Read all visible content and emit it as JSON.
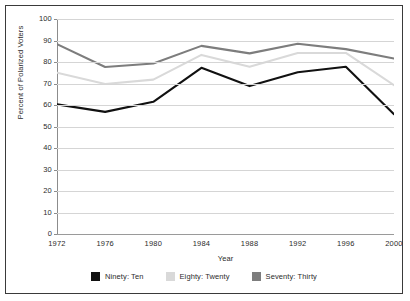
{
  "chart_data": {
    "type": "line",
    "title": "",
    "xlabel": "Year",
    "ylabel": "Percent of Polarized Voters",
    "categories": [
      "1972",
      "1976",
      "1980",
      "1984",
      "1988",
      "1992",
      "1996",
      "2000"
    ],
    "x": [
      1972,
      1976,
      1980,
      1984,
      1988,
      1992,
      1996,
      2000
    ],
    "ylim": [
      0,
      100
    ],
    "yticks": [
      0,
      10,
      20,
      30,
      40,
      50,
      60,
      70,
      80,
      90,
      100
    ],
    "grid": true,
    "legend_position": "bottom",
    "series": [
      {
        "name": "Ninety: Ten",
        "color": "#111111",
        "values": [
          60.3,
          56.8,
          61.5,
          77.3,
          68.8,
          75.2,
          77.8,
          55.7
        ]
      },
      {
        "name": "Eighty: Twenty",
        "color": "#d9d9d9",
        "values": [
          75.0,
          69.8,
          71.8,
          83.3,
          77.8,
          84.2,
          84.2,
          69.2
        ]
      },
      {
        "name": "Seventy: Thirty",
        "color": "#7d7d7d",
        "values": [
          88.3,
          77.7,
          79.3,
          87.5,
          84.0,
          88.5,
          86.0,
          81.6
        ]
      }
    ]
  },
  "axes": {
    "ytick_labels": [
      "100",
      "90",
      "80",
      "70",
      "60",
      "50",
      "40",
      "30",
      "20",
      "10",
      "0"
    ],
    "xtick_labels": [
      "1972",
      "1976",
      "1980",
      "1984",
      "1988",
      "1992",
      "1996",
      "2000"
    ],
    "y_title": "Percent of Polarized Voters",
    "x_title": "Year"
  },
  "legend": {
    "items": [
      {
        "label": "Ninety: Ten",
        "color": "#111111"
      },
      {
        "label": "Eighty: Twenty",
        "color": "#d9d9d9"
      },
      {
        "label": "Seventy: Thirty",
        "color": "#7d7d7d"
      }
    ]
  },
  "style": {
    "grid_color": "#d5d5d5",
    "axis_color": "#8c8c8c",
    "border_color": "#3a3a3a",
    "background": "#ffffff",
    "text_color": "#2b2b2b"
  }
}
